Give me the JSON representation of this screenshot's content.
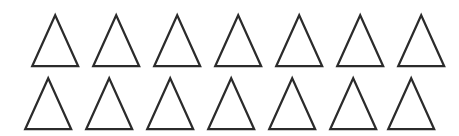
{
  "canvas": {
    "width": 459,
    "height": 136,
    "background_color": "#ffffff",
    "description": "Array of outlined upward-pointing triangles on a plain white background"
  },
  "shape": {
    "name": "triangle",
    "orientation": "up",
    "fill": "none",
    "stroke_color": "#2b2b2b",
    "stroke_width": 2.2,
    "width": 46,
    "height": 51
  },
  "layout": {
    "rows": 2,
    "columns": 7,
    "total_count": 14,
    "column_pitch": 61,
    "row_pitch": 63,
    "row_origins": [
      {
        "x": 32,
        "y": 15
      },
      {
        "x": 25,
        "y": 78
      }
    ]
  },
  "objects": [
    {
      "id": "triangle-r1-c1",
      "row": 1,
      "col": 1,
      "x": 32,
      "y": 15
    },
    {
      "id": "triangle-r1-c2",
      "row": 1,
      "col": 2,
      "x": 93,
      "y": 15
    },
    {
      "id": "triangle-r1-c3",
      "row": 1,
      "col": 3,
      "x": 154,
      "y": 15
    },
    {
      "id": "triangle-r1-c4",
      "row": 1,
      "col": 4,
      "x": 215,
      "y": 15
    },
    {
      "id": "triangle-r1-c5",
      "row": 1,
      "col": 5,
      "x": 276,
      "y": 15
    },
    {
      "id": "triangle-r1-c6",
      "row": 1,
      "col": 6,
      "x": 337,
      "y": 15
    },
    {
      "id": "triangle-r1-c7",
      "row": 1,
      "col": 7,
      "x": 398,
      "y": 15
    },
    {
      "id": "triangle-r2-c1",
      "row": 2,
      "col": 1,
      "x": 25,
      "y": 78
    },
    {
      "id": "triangle-r2-c2",
      "row": 2,
      "col": 2,
      "x": 86,
      "y": 78
    },
    {
      "id": "triangle-r2-c3",
      "row": 2,
      "col": 3,
      "x": 147,
      "y": 78
    },
    {
      "id": "triangle-r2-c4",
      "row": 2,
      "col": 4,
      "x": 208,
      "y": 78
    },
    {
      "id": "triangle-r2-c5",
      "row": 2,
      "col": 5,
      "x": 269,
      "y": 78
    },
    {
      "id": "triangle-r2-c6",
      "row": 2,
      "col": 6,
      "x": 330,
      "y": 78
    },
    {
      "id": "triangle-r2-c7",
      "row": 2,
      "col": 7,
      "x": 388,
      "y": 78
    }
  ]
}
